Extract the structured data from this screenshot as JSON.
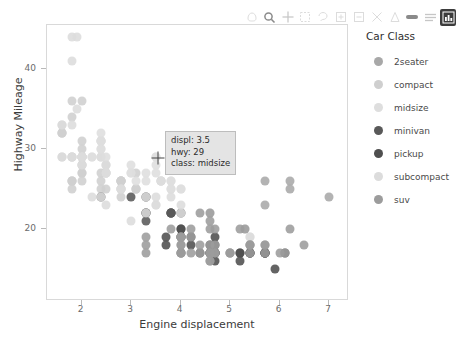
{
  "toolbar": {
    "items": [
      {
        "name": "pan-icon",
        "state": "dim"
      },
      {
        "name": "zoom-icon",
        "state": "strong"
      },
      {
        "name": "crosshair-icon",
        "state": "normal"
      },
      {
        "name": "box-select-icon",
        "state": "dim"
      },
      {
        "name": "lasso-select-icon",
        "state": "dim"
      },
      {
        "name": "zoom-in-icon",
        "state": "dim"
      },
      {
        "name": "zoom-out-icon",
        "state": "dim"
      },
      {
        "name": "autoscale-icon",
        "state": "dim"
      },
      {
        "name": "reset-axes-icon",
        "state": "dim"
      },
      {
        "name": "toggle-spike-lines-icon",
        "state": "strong"
      },
      {
        "name": "hover-compare-icon",
        "state": "normal"
      },
      {
        "name": "data-table-icon",
        "state": "active"
      }
    ]
  },
  "chart_data": {
    "type": "scatter",
    "title": "",
    "xlabel": "Engine displacement",
    "ylabel": "Highway Mileage",
    "xlim": [
      1.3,
      7.4
    ],
    "ylim": [
      11.0,
      45.5
    ],
    "xticks": [
      2,
      3,
      4,
      5,
      6,
      7
    ],
    "yticks": [
      20,
      30,
      40
    ],
    "grid": false,
    "legend_position": "right",
    "legend_title": "Car Class",
    "series": [
      {
        "name": "2seater",
        "color": "#a8a8a8",
        "points": [
          [
            5.7,
            26
          ],
          [
            5.7,
            23
          ],
          [
            6.2,
            26
          ],
          [
            6.2,
            25
          ],
          [
            7.0,
            24
          ]
        ]
      },
      {
        "name": "compact",
        "color": "#cfcfcf",
        "points": [
          [
            1.8,
            29
          ],
          [
            1.8,
            29
          ],
          [
            2.0,
            31
          ],
          [
            2.0,
            30
          ],
          [
            2.8,
            26
          ],
          [
            2.8,
            26
          ],
          [
            3.1,
            27
          ],
          [
            1.8,
            26
          ],
          [
            1.8,
            25
          ],
          [
            2.0,
            28
          ],
          [
            2.0,
            27
          ],
          [
            2.8,
            25
          ],
          [
            3.1,
            25
          ],
          [
            3.1,
            25
          ],
          [
            2.4,
            27
          ],
          [
            2.4,
            25
          ],
          [
            2.5,
            27
          ],
          [
            2.5,
            25
          ],
          [
            3.3,
            22
          ],
          [
            2.0,
            28
          ],
          [
            2.0,
            29
          ],
          [
            2.8,
            26
          ],
          [
            2.8,
            26
          ],
          [
            3.6,
            26
          ],
          [
            1.8,
            26
          ],
          [
            1.8,
            26
          ],
          [
            2.0,
            27
          ],
          [
            2.0,
            26
          ],
          [
            2.8,
            25
          ],
          [
            2.8,
            24
          ],
          [
            3.1,
            25
          ],
          [
            1.6,
            33
          ],
          [
            1.6,
            32
          ],
          [
            1.6,
            32
          ],
          [
            1.6,
            29
          ],
          [
            1.6,
            32
          ],
          [
            1.8,
            34
          ],
          [
            1.8,
            36
          ],
          [
            2.0,
            36
          ],
          [
            2.4,
            29
          ],
          [
            2.4,
            26
          ],
          [
            2.5,
            28
          ],
          [
            2.5,
            27
          ],
          [
            3.3,
            24
          ],
          [
            2.0,
            29
          ],
          [
            2.0,
            29
          ],
          [
            2.8,
            26
          ],
          [
            3.6,
            26
          ]
        ]
      },
      {
        "name": "midsize",
        "color": "#dedede",
        "points": [
          [
            2.4,
            31
          ],
          [
            2.4,
            30
          ],
          [
            3.1,
            26
          ],
          [
            3.5,
            29
          ],
          [
            2.4,
            31
          ],
          [
            2.4,
            30
          ],
          [
            3.0,
            27
          ],
          [
            3.5,
            27
          ],
          [
            3.3,
            27
          ],
          [
            3.8,
            26
          ],
          [
            3.8,
            25
          ],
          [
            4.0,
            25
          ],
          [
            2.4,
            32
          ],
          [
            2.4,
            29
          ],
          [
            2.5,
            29
          ],
          [
            2.5,
            27
          ],
          [
            3.3,
            26
          ],
          [
            3.5,
            28
          ],
          [
            3.6,
            26
          ],
          [
            2.2,
            29
          ],
          [
            2.2,
            29
          ],
          [
            2.4,
            31
          ],
          [
            2.4,
            31
          ],
          [
            3.0,
            28
          ],
          [
            3.0,
            27
          ],
          [
            3.5,
            29
          ],
          [
            3.3,
            24
          ],
          [
            3.8,
            25
          ],
          [
            3.8,
            26
          ],
          [
            4.0,
            25
          ]
        ]
      },
      {
        "name": "minivan",
        "color": "#595959",
        "points": [
          [
            2.4,
            24
          ],
          [
            3.0,
            24
          ],
          [
            3.3,
            22
          ],
          [
            3.3,
            22
          ],
          [
            3.8,
            22
          ],
          [
            3.8,
            22
          ],
          [
            4.0,
            22
          ],
          [
            3.3,
            24
          ],
          [
            3.8,
            22
          ],
          [
            3.3,
            21
          ],
          [
            3.8,
            22
          ]
        ]
      },
      {
        "name": "pickup",
        "color": "#4f4f4f",
        "points": [
          [
            4.7,
            17
          ],
          [
            5.2,
            17
          ],
          [
            5.7,
            17
          ],
          [
            4.7,
            16
          ],
          [
            5.2,
            17
          ],
          [
            5.7,
            17
          ],
          [
            4.7,
            17
          ],
          [
            4.7,
            17
          ],
          [
            5.2,
            16
          ],
          [
            5.7,
            17
          ],
          [
            5.9,
            15
          ],
          [
            4.6,
            17
          ],
          [
            5.4,
            17
          ],
          [
            5.4,
            17
          ],
          [
            4.0,
            20
          ],
          [
            4.0,
            19
          ],
          [
            4.2,
            19
          ],
          [
            4.6,
            18
          ],
          [
            4.6,
            17
          ],
          [
            4.6,
            17
          ],
          [
            5.4,
            17
          ],
          [
            3.7,
            19
          ],
          [
            3.7,
            18
          ],
          [
            4.0,
            17
          ],
          [
            4.0,
            19
          ],
          [
            4.7,
            19
          ],
          [
            4.7,
            18
          ],
          [
            4.7,
            17
          ],
          [
            5.7,
            17
          ],
          [
            6.1,
            17
          ],
          [
            4.0,
            20
          ],
          [
            4.2,
            18
          ],
          [
            4.4,
            17
          ]
        ]
      },
      {
        "name": "subcompact",
        "color": "#dcdcdc",
        "points": [
          [
            1.8,
            44
          ],
          [
            1.8,
            41
          ],
          [
            1.8,
            33
          ],
          [
            1.8,
            29
          ],
          [
            2.0,
            29
          ],
          [
            2.0,
            28
          ],
          [
            2.0,
            29
          ],
          [
            2.0,
            29
          ],
          [
            2.5,
            28
          ],
          [
            2.5,
            27
          ],
          [
            2.8,
            25
          ],
          [
            2.8,
            25
          ],
          [
            3.3,
            24
          ],
          [
            3.3,
            22
          ],
          [
            3.8,
            24
          ],
          [
            4.0,
            22
          ],
          [
            4.0,
            23
          ],
          [
            4.6,
            22
          ],
          [
            5.4,
            19
          ],
          [
            5.4,
            19
          ],
          [
            1.6,
            33
          ],
          [
            1.6,
            29
          ],
          [
            2.4,
            24
          ],
          [
            3.0,
            21
          ],
          [
            3.5,
            24
          ],
          [
            3.5,
            23
          ],
          [
            3.5,
            23
          ],
          [
            1.9,
            35
          ],
          [
            1.9,
            44
          ],
          [
            2.0,
            29
          ],
          [
            2.2,
            24
          ],
          [
            2.5,
            23
          ],
          [
            5.3,
            20
          ]
        ]
      },
      {
        "name": "suv",
        "color": "#9c9c9c",
        "points": [
          [
            4.0,
            19
          ],
          [
            4.0,
            18
          ],
          [
            4.6,
            17
          ],
          [
            5.0,
            17
          ],
          [
            4.2,
            17
          ],
          [
            4.4,
            17
          ],
          [
            4.6,
            16
          ],
          [
            5.4,
            17
          ],
          [
            3.3,
            18
          ],
          [
            3.3,
            17
          ],
          [
            4.0,
            17
          ],
          [
            4.0,
            17
          ],
          [
            4.6,
            16
          ],
          [
            5.0,
            17
          ],
          [
            5.7,
            17
          ],
          [
            6.0,
            17
          ],
          [
            4.6,
            20
          ],
          [
            5.4,
            18
          ],
          [
            5.4,
            18
          ],
          [
            4.0,
            18
          ],
          [
            4.7,
            18
          ],
          [
            4.7,
            17
          ],
          [
            4.7,
            17
          ],
          [
            5.7,
            18
          ],
          [
            6.1,
            17
          ],
          [
            4.0,
            19
          ],
          [
            4.0,
            19
          ],
          [
            4.6,
            18
          ],
          [
            5.0,
            17
          ],
          [
            4.2,
            19
          ],
          [
            4.4,
            18
          ],
          [
            4.6,
            17
          ],
          [
            5.4,
            18
          ],
          [
            3.3,
            19
          ],
          [
            4.7,
            20
          ],
          [
            5.2,
            20
          ],
          [
            5.7,
            18
          ],
          [
            6.5,
            18
          ],
          [
            4.2,
            20
          ],
          [
            3.8,
            20
          ],
          [
            6.2,
            20
          ],
          [
            5.3,
            20
          ],
          [
            4.4,
            22
          ],
          [
            4.6,
            21
          ],
          [
            4.6,
            22
          ]
        ]
      }
    ],
    "tooltip": {
      "displ_label": "displ: 3.5",
      "hwy_label": "hwy: 29",
      "class_label": "class: midsize"
    }
  },
  "legend": {
    "title": "Car Class",
    "items": [
      {
        "label": "2seater",
        "color": "#a8a8a8"
      },
      {
        "label": "compact",
        "color": "#cfcfcf"
      },
      {
        "label": "midsize",
        "color": "#dedede"
      },
      {
        "label": "minivan",
        "color": "#595959"
      },
      {
        "label": "pickup",
        "color": "#4f4f4f"
      },
      {
        "label": "subcompact",
        "color": "#dcdcdc"
      },
      {
        "label": "suv",
        "color": "#9c9c9c"
      }
    ]
  }
}
